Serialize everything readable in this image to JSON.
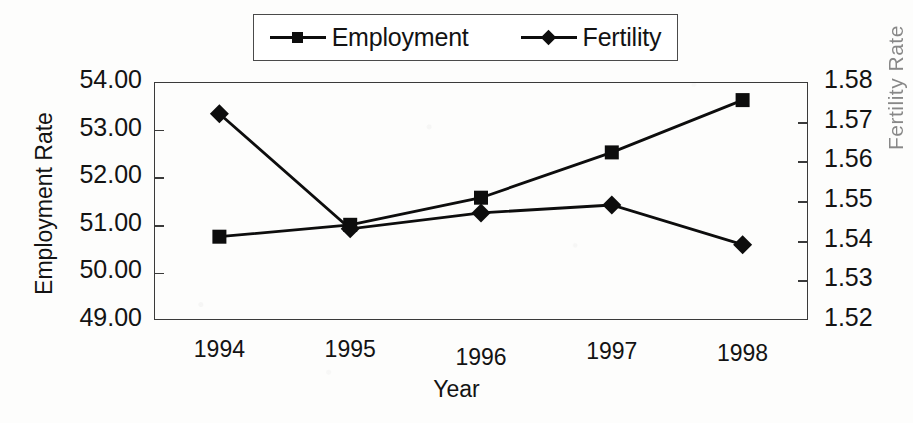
{
  "chart_data": {
    "type": "line",
    "title": "",
    "xlabel": "Year",
    "ylabel": "Employment Rate",
    "ylabel_right": "Fertility Rate",
    "categories": [
      "1994",
      "1995",
      "1996",
      "1997",
      "1998"
    ],
    "x": [
      1994,
      1995,
      1996,
      1997,
      1998
    ],
    "series": [
      {
        "name": "Employment",
        "axis": "left",
        "marker": "square",
        "color": "#0d0d0d",
        "values": [
          50.75,
          51.0,
          51.57,
          52.52,
          53.62
        ]
      },
      {
        "name": "Fertility",
        "axis": "right",
        "marker": "diamond",
        "color": "#0d0d0d",
        "values": [
          1.572,
          1.543,
          1.547,
          1.549,
          1.539
        ]
      }
    ],
    "ylim": [
      49.0,
      54.0
    ],
    "ylim_right": [
      1.52,
      1.58
    ],
    "ytick_labels": [
      "54.00",
      "53.00",
      "52.00",
      "51.00",
      "50.00",
      "49.00"
    ],
    "ytick_values": [
      54.0,
      53.0,
      52.0,
      51.0,
      50.0,
      49.0
    ],
    "ytick_labels_right": [
      "1.58",
      "1.57",
      "1.56",
      "1.55",
      "1.54",
      "1.53",
      "1.52"
    ],
    "ytick_values_right": [
      1.58,
      1.57,
      1.56,
      1.55,
      1.54,
      1.53,
      1.52
    ],
    "grid": false,
    "legend_position": "top"
  },
  "legend": {
    "entries": [
      {
        "label": "Employment",
        "marker": "square"
      },
      {
        "label": "Fertility",
        "marker": "diamond"
      }
    ]
  },
  "axes": {
    "left_title": "Employment Rate",
    "right_title_fragment": "Fertility Rate",
    "bottom_title": "Year"
  },
  "colors": {
    "ink": "#0d0d0d",
    "frame": "#3a3a3a",
    "paper": "#fdfdfc"
  }
}
